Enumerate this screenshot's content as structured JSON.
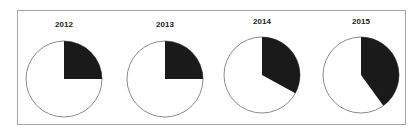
{
  "chart_data": {
    "type": "pie",
    "title": "",
    "charts": [
      {
        "title": "2012",
        "slices": [
          {
            "label": "dark",
            "value": 25,
            "color": "#1a1a1a"
          },
          {
            "label": "light",
            "value": 75,
            "color": "#ffffff"
          }
        ]
      },
      {
        "title": "2013",
        "slices": [
          {
            "label": "dark",
            "value": 25,
            "color": "#1a1a1a"
          },
          {
            "label": "light",
            "value": 75,
            "color": "#ffffff"
          }
        ]
      },
      {
        "title": "2014",
        "slices": [
          {
            "label": "dark",
            "value": 33,
            "color": "#1a1a1a"
          },
          {
            "label": "light",
            "value": 67,
            "color": "#ffffff"
          }
        ]
      },
      {
        "title": "2015",
        "slices": [
          {
            "label": "dark",
            "value": 40,
            "color": "#1a1a1a"
          },
          {
            "label": "light",
            "value": 60,
            "color": "#ffffff"
          }
        ]
      }
    ],
    "legend": null,
    "start_angle": "12 o'clock, clockwise"
  },
  "colors": {
    "dark_slice": "#1a1a1a",
    "light_slice": "#ffffff",
    "outline": "#8c8c8c",
    "frame": "#a6a6a6"
  },
  "layout": {
    "pies": [
      {
        "cx": 64,
        "cy": 79,
        "r": 38,
        "title_y": 20
      },
      {
        "cx": 165,
        "cy": 79,
        "r": 38,
        "title_y": 20
      },
      {
        "cx": 262,
        "cy": 75,
        "r": 38,
        "title_y": 17
      },
      {
        "cx": 361,
        "cy": 75,
        "r": 38,
        "title_y": 17
      }
    ]
  }
}
